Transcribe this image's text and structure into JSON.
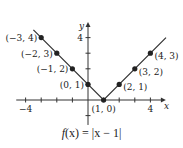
{
  "chart_data": {
    "type": "line",
    "title": "",
    "caption": "f(x) = |x − 1|",
    "function": "f(x) = |x - 1|",
    "xlabel": "x",
    "ylabel": "y",
    "xlim": [
      -4.6,
      4.8
    ],
    "ylim": [
      -1.6,
      4.8
    ],
    "grid": false,
    "x_ticks": [
      -4,
      -3,
      -2,
      -1,
      1,
      2,
      3,
      4
    ],
    "y_ticks": [
      -1,
      1,
      2,
      3,
      4
    ],
    "x_tick_labels": [
      {
        "value": -4,
        "label": "−4"
      },
      {
        "value": 4,
        "label": "4"
      }
    ],
    "y_tick_labels": [
      {
        "value": 4,
        "label": "4"
      }
    ],
    "series": [
      {
        "name": "f(x) = |x - 1|",
        "color": "#333333",
        "x": [
          -3.5,
          1,
          5
        ],
        "y": [
          4.5,
          0,
          4
        ]
      }
    ],
    "points": [
      {
        "x": -3,
        "y": 4,
        "label": "(−3, 4)",
        "label_side": "left"
      },
      {
        "x": -2,
        "y": 3,
        "label": "(−2, 3)",
        "label_side": "left"
      },
      {
        "x": -1,
        "y": 2,
        "label": "(−1, 2)",
        "label_side": "left"
      },
      {
        "x": 0,
        "y": 1,
        "label": "(0, 1)",
        "label_side": "left"
      },
      {
        "x": 1,
        "y": 0,
        "label": "(1, 0)",
        "label_side": "below"
      },
      {
        "x": 2,
        "y": 1,
        "label": "(2, 1)",
        "label_side": "right"
      },
      {
        "x": 3,
        "y": 2,
        "label": "(3, 2)",
        "label_side": "right"
      },
      {
        "x": 4,
        "y": 3,
        "label": "(4, 3)",
        "label_side": "right"
      }
    ],
    "legend": null
  },
  "caption": {
    "prefix": "f",
    "body": "(x) = |x − 1|"
  }
}
